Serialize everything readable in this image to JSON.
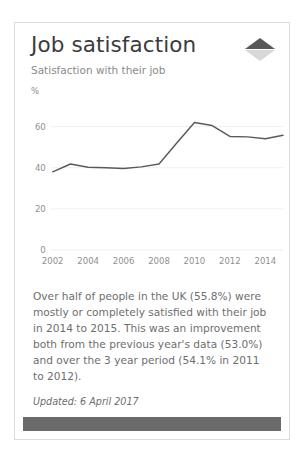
{
  "card": {
    "title": "Job satisfaction",
    "subtitle": "Satisfaction with their job",
    "toggle_icon": "collapse-expand-triangles-icon",
    "body_paragraph": "Over half of people in the UK (55.8%) were mostly or completely satisfied with their job in 2014 to 2015. This was an improvement both from the previous year's data (53.0%) and over the 3 year period (54.1% in 2011 to 2012).",
    "updated": "Updated: 6 April 2017"
  },
  "colors": {
    "card_border": "#dcdcdc",
    "title_text": "#3b3b3b",
    "body_text": "#6e6e6e",
    "muted_text": "#8a8a8a",
    "line_series": "#5a5a5a",
    "gridline": "#f0f0f0",
    "footer_bar": "#6b6b6b",
    "triangle_up": "#575757",
    "triangle_down": "#d8d8d8"
  },
  "chart_data": {
    "type": "line",
    "title": "Job satisfaction",
    "subtitle": "Satisfaction with their job",
    "xlabel": "",
    "ylabel": "%",
    "unit_label": "%",
    "grid": true,
    "legend": "none",
    "ylim": [
      0,
      70
    ],
    "yticks": [
      0,
      20,
      40,
      60
    ],
    "ytick_labels": [
      "0",
      "20",
      "40",
      "60"
    ],
    "xlim": [
      2002,
      2015
    ],
    "xticks": [
      2002,
      2004,
      2006,
      2008,
      2010,
      2012,
      2014
    ],
    "xtick_labels": [
      "2002",
      "2004",
      "2006",
      "2008",
      "2010",
      "2012",
      "2014"
    ],
    "x": [
      2002,
      2003,
      2004,
      2005,
      2006,
      2007,
      2008,
      2009,
      2010,
      2011,
      2012,
      2013,
      2014,
      2015
    ],
    "series": [
      {
        "name": "Satisfaction with their job",
        "values": [
          38.0,
          41.8,
          40.2,
          40.0,
          39.6,
          40.4,
          41.8,
          52.0,
          62.0,
          60.5,
          55.2,
          55.0,
          54.1,
          55.8
        ]
      }
    ]
  }
}
